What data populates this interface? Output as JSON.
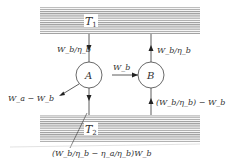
{
  "diagram": {
    "reservoirs": {
      "hot": {
        "label": "T",
        "subscript": "1"
      },
      "cold": {
        "label": "T",
        "subscript": "2"
      }
    },
    "engines": {
      "a": {
        "label": "A"
      },
      "b": {
        "label": "B"
      }
    },
    "flows": {
      "a_in": "W_b/η_b",
      "a_out_work": "W_a − W_b",
      "a_to_b_work": "W_b",
      "b_to_hot": "W_b/η_b",
      "b_from_cold": "(W_b/η_b) − W_b",
      "a_to_cold": "(W_b/η_b − η_a/η_b)W_b"
    },
    "colors": {
      "hatch": "#9a9a9a",
      "line": "#333333",
      "background": "#ffffff"
    }
  }
}
